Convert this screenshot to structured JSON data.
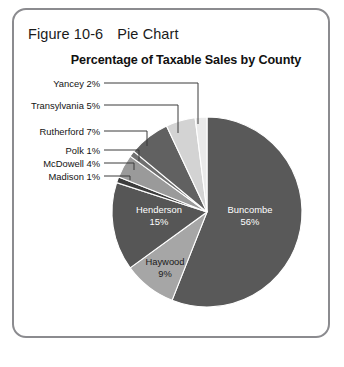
{
  "figure": {
    "caption_label": "Figure 10-6",
    "caption_text": "Pie Chart"
  },
  "chart_data": {
    "type": "pie",
    "title": "Percentage of Taxable Sales by County",
    "xlabel": "",
    "ylabel": "",
    "categories": [
      "Buncombe",
      "Haywood",
      "Henderson",
      "Madison",
      "McDowell",
      "Polk",
      "Rutherford",
      "Transylvania",
      "Yancey"
    ],
    "values": [
      56,
      9,
      15,
      1,
      4,
      1,
      7,
      5,
      2
    ],
    "value_suffix": "%",
    "legend": "none",
    "start_angle_deg": 0,
    "direction": "clockwise",
    "slices": [
      {
        "name": "Buncombe",
        "value": 56,
        "value_text": "56%",
        "color": "#595959",
        "label_placement": "inside",
        "label_color": "light"
      },
      {
        "name": "Haywood",
        "value": 9,
        "value_text": "9%",
        "color": "#a6a6a6",
        "label_placement": "inside",
        "label_color": "dark"
      },
      {
        "name": "Henderson",
        "value": 15,
        "value_text": "15%",
        "color": "#565656",
        "label_placement": "inside",
        "label_color": "light"
      },
      {
        "name": "Madison",
        "value": 1,
        "value_text": "1%",
        "color": "#3d3d3d",
        "label_placement": "callout",
        "label_color": "dark"
      },
      {
        "name": "McDowell",
        "value": 4,
        "value_text": "4%",
        "color": "#9a9a9a",
        "label_placement": "callout",
        "label_color": "dark"
      },
      {
        "name": "Polk",
        "value": 1,
        "value_text": "1%",
        "color": "#707070",
        "label_placement": "callout",
        "label_color": "dark"
      },
      {
        "name": "Rutherford",
        "value": 7,
        "value_text": "7%",
        "color": "#616161",
        "label_placement": "callout",
        "label_color": "dark"
      },
      {
        "name": "Transylvania",
        "value": 5,
        "value_text": "5%",
        "color": "#d3d3d3",
        "label_placement": "callout",
        "label_color": "dark"
      },
      {
        "name": "Yancey",
        "value": 2,
        "value_text": "2%",
        "color": "#eaeaea",
        "label_placement": "callout",
        "label_color": "dark"
      }
    ]
  },
  "callouts": [
    {
      "name": "yancey",
      "text": "Yancey 2%",
      "label_right_x": 100,
      "label_y": 83,
      "elbow_x": 198,
      "target_y": 124
    },
    {
      "name": "transylvania",
      "text": "Transylvania 5%",
      "label_right_x": 100,
      "label_y": 105,
      "elbow_x": 178,
      "target_y": 133
    },
    {
      "name": "rutherford",
      "text": "Rutherford 7%",
      "label_right_x": 100,
      "label_y": 131,
      "elbow_x": 147,
      "target_y": 146
    },
    {
      "name": "polk",
      "text": "Polk 1%",
      "label_right_x": 100,
      "label_y": 150,
      "elbow_x": 139,
      "target_y": 161
    },
    {
      "name": "mcdowell",
      "text": "McDowell 4%",
      "label_right_x": 100,
      "label_y": 163,
      "elbow_x": 134,
      "target_y": 170
    },
    {
      "name": "madison",
      "text": "Madison 1%",
      "label_right_x": 100,
      "label_y": 176,
      "elbow_x": 130,
      "target_y": 180
    }
  ],
  "inside_labels": [
    {
      "name": "buncombe",
      "title": "Buncombe",
      "pct": "56%",
      "x": 250,
      "y": 216,
      "tone": "light"
    },
    {
      "name": "henderson",
      "title": "Henderson",
      "pct": "15%",
      "x": 159,
      "y": 216,
      "tone": "light"
    },
    {
      "name": "haywood",
      "title": "Haywood",
      "pct": "9%",
      "x": 165,
      "y": 268,
      "tone": "dark"
    }
  ],
  "geometry": {
    "center_x": 207,
    "center_y": 212,
    "radius": 95
  },
  "colors": {
    "frame": "#8b8b8f",
    "background": "#ffffff",
    "leader_line": "#3a3a3a",
    "text": "#141414"
  }
}
